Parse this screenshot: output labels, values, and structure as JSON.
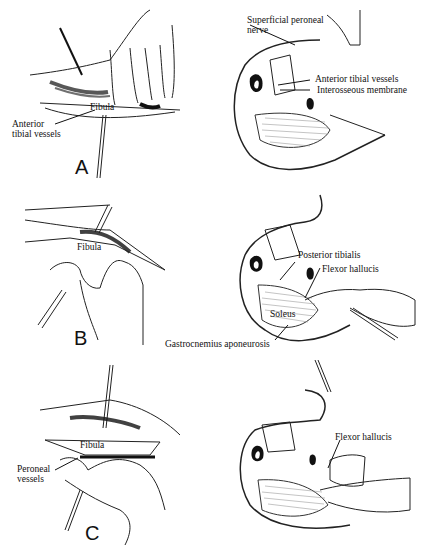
{
  "figure": {
    "panels": [
      {
        "letter": "A",
        "left_labels": {
          "fibula": "Fibula",
          "vessels": "Anterior tibial vessels",
          "vessels_line1": "Anterior",
          "vessels_line2": "tibial vessels"
        },
        "right_labels": {
          "nerve_line1": "Superficial peroneal",
          "nerve_line2": "nerve",
          "ant_tibial": "Anterior tibial vessels",
          "interosseous": "Interosseous membrane"
        }
      },
      {
        "letter": "B",
        "left_labels": {
          "fibula": "Fibula"
        },
        "right_labels": {
          "posterior_tibialis": "Posterior tibialis",
          "flexor_hallucis": "Flexor hallucis",
          "soleus": "Soleus",
          "gastrocnemius": "Gastrocnemius aponeurosis"
        }
      },
      {
        "letter": "C",
        "left_labels": {
          "fibula": "Fibula",
          "vessels_line1": "Peroneal",
          "vessels_line2": "vessels"
        },
        "right_labels": {
          "flexor_hallucis": "Flexor hallucis"
        }
      }
    ]
  },
  "colors": {
    "ink": "#111111",
    "background": "#ffffff"
  }
}
